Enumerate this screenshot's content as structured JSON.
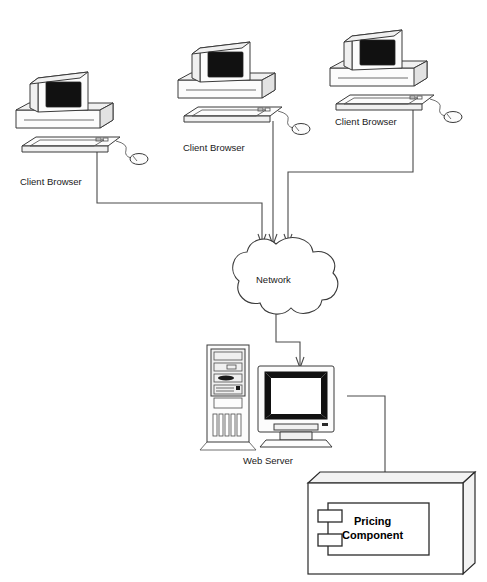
{
  "diagram": {
    "background_color": "#ffffff",
    "line_color": "#3a3a3a",
    "clients": [
      {
        "label": "Client Browser",
        "icon": "desktop-computer-icon"
      },
      {
        "label": "Client Browser",
        "icon": "desktop-computer-icon"
      },
      {
        "label": "Client Browser",
        "icon": "desktop-computer-icon"
      }
    ],
    "network": {
      "label": "Network",
      "icon": "cloud-icon"
    },
    "server": {
      "label": "Web Server",
      "icon": "tower-server-icon"
    },
    "component": {
      "label_line1": "Pricing",
      "label_line2": "Component",
      "icon": "uml-component-icon"
    }
  }
}
